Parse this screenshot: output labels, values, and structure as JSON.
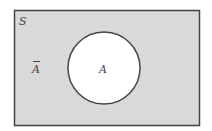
{
  "diagram": {
    "type": "venn",
    "universe_label": "S",
    "set_label": "A",
    "complement_label": "A",
    "complement_has_overbar": true,
    "colors": {
      "universe_fill": "#d9d9d9",
      "set_fill": "#ffffff",
      "border": "#444444",
      "text": "#444444"
    }
  }
}
